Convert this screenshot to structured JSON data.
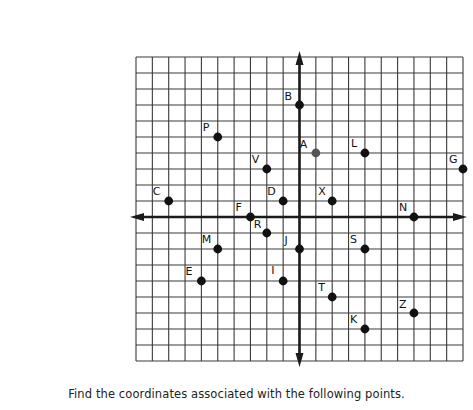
{
  "worksheet": {
    "caption": "Find the coordinates associated with the following points."
  },
  "grid": {
    "left_px": 136,
    "top_px": 57,
    "cols": 20,
    "rows": 19,
    "cell_w": 16.35,
    "cell_h": 16.0,
    "origin_col": 10,
    "origin_row": 10,
    "line_color": "#3a3a3a",
    "axis_color": "#1a1a1a"
  },
  "chart_data": {
    "type": "scatter",
    "title": "",
    "xlabel": "",
    "ylabel": "",
    "xlim": [
      -10,
      10
    ],
    "ylim": [
      -9,
      10
    ],
    "grid": true,
    "points": [
      {
        "label": "A",
        "x": 1,
        "y": 4,
        "color": "#555555",
        "label_dx": -16,
        "label_dy": -5
      },
      {
        "label": "B",
        "x": 0,
        "y": 7,
        "color": "#111111",
        "label_dx": -15,
        "label_dy": -5
      },
      {
        "label": "C",
        "x": -8,
        "y": 1,
        "color": "#111111",
        "label_dx": -16,
        "label_dy": -6
      },
      {
        "label": "D",
        "x": -1,
        "y": 1,
        "color": "#111111",
        "label_dx": -16,
        "label_dy": -6
      },
      {
        "label": "E",
        "x": -6,
        "y": -4,
        "color": "#111111",
        "label_dx": -16,
        "label_dy": -6
      },
      {
        "label": "F",
        "x": -3,
        "y": 0,
        "color": "#111111",
        "label_dx": -15,
        "label_dy": -6
      },
      {
        "label": "G",
        "x": 10,
        "y": 3,
        "color": "#111111",
        "label_dx": -14,
        "label_dy": -6
      },
      {
        "label": "I",
        "x": -1,
        "y": -4,
        "color": "#111111",
        "label_dx": -12,
        "label_dy": -7
      },
      {
        "label": "J",
        "x": 0,
        "y": -2,
        "color": "#111111",
        "label_dx": -15,
        "label_dy": -5
      },
      {
        "label": "K",
        "x": 4,
        "y": -7,
        "color": "#111111",
        "label_dx": -15,
        "label_dy": -6
      },
      {
        "label": "L",
        "x": 4,
        "y": 4,
        "color": "#111111",
        "label_dx": -14,
        "label_dy": -6
      },
      {
        "label": "M",
        "x": -5,
        "y": -2,
        "color": "#111111",
        "label_dx": -16,
        "label_dy": -6
      },
      {
        "label": "N",
        "x": 7,
        "y": 0,
        "color": "#111111",
        "label_dx": -15,
        "label_dy": -6
      },
      {
        "label": "P",
        "x": -5,
        "y": 5,
        "color": "#111111",
        "label_dx": -15,
        "label_dy": -6
      },
      {
        "label": "R",
        "x": -2,
        "y": -1,
        "color": "#111111",
        "label_dx": -13,
        "label_dy": -5
      },
      {
        "label": "S",
        "x": 4,
        "y": -2,
        "color": "#111111",
        "label_dx": -15,
        "label_dy": -6
      },
      {
        "label": "T",
        "x": 2,
        "y": -5,
        "color": "#111111",
        "label_dx": -14,
        "label_dy": -6
      },
      {
        "label": "V",
        "x": -2,
        "y": 3,
        "color": "#111111",
        "label_dx": -15,
        "label_dy": -6
      },
      {
        "label": "X",
        "x": 2,
        "y": 1,
        "color": "#111111",
        "label_dx": -14,
        "label_dy": -6
      },
      {
        "label": "Z",
        "x": 7,
        "y": -6,
        "color": "#111111",
        "label_dx": -15,
        "label_dy": -5
      }
    ]
  }
}
